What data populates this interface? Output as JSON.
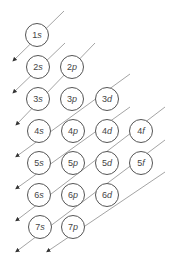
{
  "diagram": {
    "line_color": "#9a9a9a",
    "circle_border": "#555555",
    "orbitals": [
      {
        "n": "1",
        "l": "s",
        "x": 37,
        "y": 35
      },
      {
        "n": "2",
        "l": "s",
        "x": 38,
        "y": 67
      },
      {
        "n": "2",
        "l": "p",
        "x": 72,
        "y": 67
      },
      {
        "n": "3",
        "l": "s",
        "x": 38,
        "y": 99
      },
      {
        "n": "3",
        "l": "p",
        "x": 72,
        "y": 99
      },
      {
        "n": "3",
        "l": "d",
        "x": 107,
        "y": 99
      },
      {
        "n": "4",
        "l": "s",
        "x": 39,
        "y": 131
      },
      {
        "n": "4",
        "l": "p",
        "x": 73,
        "y": 131
      },
      {
        "n": "4",
        "l": "d",
        "x": 107,
        "y": 131
      },
      {
        "n": "4",
        "l": "f",
        "x": 141,
        "y": 131
      },
      {
        "n": "5",
        "l": "s",
        "x": 39,
        "y": 163
      },
      {
        "n": "5",
        "l": "p",
        "x": 73,
        "y": 163
      },
      {
        "n": "5",
        "l": "d",
        "x": 107,
        "y": 163
      },
      {
        "n": "5",
        "l": "f",
        "x": 141,
        "y": 163
      },
      {
        "n": "6",
        "l": "s",
        "x": 39,
        "y": 195
      },
      {
        "n": "6",
        "l": "p",
        "x": 73,
        "y": 195
      },
      {
        "n": "6",
        "l": "d",
        "x": 107,
        "y": 195
      },
      {
        "n": "7",
        "l": "s",
        "x": 40,
        "y": 227
      },
      {
        "n": "7",
        "l": "p",
        "x": 73,
        "y": 227
      }
    ],
    "arrows": [
      {
        "x1": 64,
        "y1": 11,
        "x2": 14,
        "y2": 60
      },
      {
        "x1": 65,
        "y1": 43,
        "x2": 14,
        "y2": 92
      },
      {
        "x1": 95,
        "y1": 43,
        "x2": 17,
        "y2": 124
      },
      {
        "x1": 130,
        "y1": 74,
        "x2": 17,
        "y2": 156
      },
      {
        "x1": 130,
        "y1": 107,
        "x2": 17,
        "y2": 188
      },
      {
        "x1": 165,
        "y1": 107,
        "x2": 17,
        "y2": 220
      },
      {
        "x1": 165,
        "y1": 140,
        "x2": 17,
        "y2": 251
      },
      {
        "x1": 165,
        "y1": 172,
        "x2": 48,
        "y2": 251
      }
    ]
  }
}
